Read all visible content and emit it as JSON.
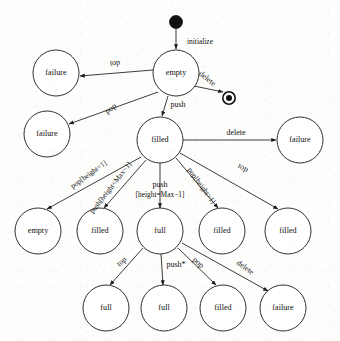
{
  "diagram": {
    "type": "uml-statechart",
    "width": 340,
    "height": 341,
    "colors": {
      "stroke": "#1a1a1a",
      "text": "#111111",
      "background": "#fdfdfc",
      "node_fill": "#ffffff"
    },
    "initial_state": {
      "name": "initial-pseudostate",
      "cx": 176,
      "cy": 22,
      "r": 6.5
    },
    "final_state": {
      "name": "final-state",
      "cx": 229,
      "cy": 98,
      "r_outer": 6.2,
      "r_inner": 3.0
    },
    "nodes": [
      {
        "id": "empty_root",
        "label": "empty",
        "cx": 176,
        "cy": 73,
        "r": 23
      },
      {
        "id": "fail_top",
        "label": "failure",
        "cx": 56,
        "cy": 73,
        "r": 23
      },
      {
        "id": "fail_pop",
        "label": "failure",
        "cx": 47,
        "cy": 134,
        "r": 23
      },
      {
        "id": "filled_root",
        "label": "filled",
        "cx": 160,
        "cy": 140,
        "r": 23
      },
      {
        "id": "fail_delete",
        "label": "failure",
        "cx": 300,
        "cy": 140,
        "r": 23
      },
      {
        "id": "empty_r3",
        "label": "empty",
        "cx": 38,
        "cy": 231,
        "r": 23
      },
      {
        "id": "filled_r3_a",
        "label": "filled",
        "cx": 100,
        "cy": 231,
        "r": 23
      },
      {
        "id": "full_root",
        "label": "full",
        "cx": 160,
        "cy": 231,
        "r": 23
      },
      {
        "id": "filled_r3_b",
        "label": "filled",
        "cx": 222,
        "cy": 231,
        "r": 23
      },
      {
        "id": "filled_r3_c",
        "label": "filled",
        "cx": 288,
        "cy": 231,
        "r": 23
      },
      {
        "id": "full_r4_a",
        "label": "full",
        "cx": 106,
        "cy": 308,
        "r": 23
      },
      {
        "id": "full_r4_b",
        "label": "full",
        "cx": 164,
        "cy": 308,
        "r": 23
      },
      {
        "id": "filled_r4",
        "label": "filled",
        "cx": 223,
        "cy": 308,
        "r": 23
      },
      {
        "id": "failure_r4",
        "label": "failure",
        "cx": 283,
        "cy": 308,
        "r": 23
      }
    ],
    "edges": [
      {
        "id": "e_init",
        "label": "initialize",
        "from": "initial-pseudostate",
        "to": "empty_root",
        "label_x": 200,
        "label_y": 42,
        "rotate": 0,
        "x1": 176,
        "y1": 29,
        "x2": 176,
        "y2": 49
      },
      {
        "id": "e_empty_top",
        "label": "top",
        "from": "empty_root",
        "to": "fail_top",
        "label_x": 115,
        "label_y": 63,
        "rotate": -7,
        "x1": 153,
        "y1": 70,
        "x2": 80,
        "y2": 76
      },
      {
        "id": "e_empty_del",
        "label": "delete",
        "from": "empty_root",
        "to": "final-state",
        "label_x": 207,
        "label_y": 79,
        "rotate": 39,
        "x1": 194,
        "y1": 86,
        "x2": 223,
        "y2": 92
      },
      {
        "id": "e_empty_pop",
        "label": "pop",
        "from": "empty_root",
        "to": "fail_pop",
        "label_x": 111,
        "label_y": 109,
        "rotate": -37,
        "x1": 158,
        "y1": 92,
        "x2": 69,
        "y2": 124
      },
      {
        "id": "e_empty_push",
        "label": "push",
        "from": "empty_root",
        "to": "filled_root",
        "label_x": 178,
        "label_y": 105,
        "rotate": 0,
        "x1": 168,
        "y1": 96,
        "x2": 162,
        "y2": 116
      },
      {
        "id": "e_filled_del",
        "label": "delete",
        "from": "filled_root",
        "to": "fail_delete",
        "label_x": 236,
        "label_y": 133,
        "rotate": 0,
        "x1": 183,
        "y1": 140,
        "x2": 276,
        "y2": 140
      },
      {
        "id": "e_filled_pop1",
        "label": "pop[height=1]",
        "from": "filled_root",
        "to": "empty_r3",
        "label_x": 89,
        "label_y": 175,
        "rotate": -36,
        "x1": 141,
        "y1": 157,
        "x2": 47,
        "y2": 209
      },
      {
        "id": "e_filled_pushlt",
        "label": "push[height<Max−1]",
        "from": "filled_root",
        "to": "filled_r3_a",
        "label_x": 111,
        "label_y": 188,
        "rotate": -52,
        "x1": 146,
        "y1": 160,
        "x2": 104,
        "y2": 208
      },
      {
        "id": "e_filled_pusheq",
        "label": "push",
        "from": "filled_root",
        "to": "full_root",
        "label_x": 160,
        "label_y": 185,
        "rotate": 0,
        "x1": 160,
        "y1": 163,
        "x2": 160,
        "y2": 208
      },
      {
        "id": "e_filled_pusheq2",
        "label": "[height=Max−1]",
        "from": "filled_root",
        "to": "full_root",
        "label_x": 160,
        "label_y": 195,
        "rotate": 0,
        "x1": 0,
        "y1": 0,
        "x2": 0,
        "y2": 0
      },
      {
        "id": "e_filled_popgt",
        "label": "pop[height>1]",
        "from": "filled_root",
        "to": "filled_r3_b",
        "label_x": 201,
        "label_y": 186,
        "rotate": 54,
        "x1": 176,
        "y1": 158,
        "x2": 218,
        "y2": 208
      },
      {
        "id": "e_filled_top",
        "label": "top",
        "from": "filled_root",
        "to": "filled_r3_c",
        "label_x": 243,
        "label_y": 168,
        "rotate": 27,
        "x1": 180,
        "y1": 153,
        "x2": 278,
        "y2": 209
      },
      {
        "id": "e_full_top",
        "label": "top",
        "from": "full_root",
        "to": "full_r4_a",
        "label_x": 122,
        "label_y": 262,
        "rotate": -39,
        "x1": 143,
        "y1": 248,
        "x2": 110,
        "y2": 285
      },
      {
        "id": "e_full_push",
        "label": "push*",
        "from": "full_root",
        "to": "full_r4_b",
        "label_x": 176,
        "label_y": 265,
        "rotate": 0,
        "x1": 161,
        "y1": 254,
        "x2": 163,
        "y2": 285
      },
      {
        "id": "e_full_pop",
        "label": "pop",
        "from": "full_root",
        "to": "filled_r4",
        "label_x": 198,
        "label_y": 263,
        "rotate": 40,
        "x1": 178,
        "y1": 248,
        "x2": 216,
        "y2": 285
      },
      {
        "id": "e_full_del",
        "label": "delete",
        "from": "full_root",
        "to": "failure_r4",
        "label_x": 245,
        "label_y": 268,
        "rotate": 35,
        "x1": 182,
        "y1": 243,
        "x2": 268,
        "y2": 291
      }
    ]
  }
}
